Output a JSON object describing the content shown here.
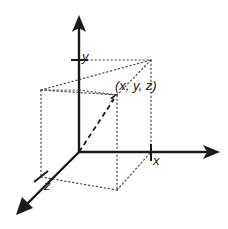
{
  "figure": {
    "type": "diagram",
    "background_color": "#ffffff",
    "stroke_color": "#1a1a1a",
    "dotted_color": "#4d4d4d"
  },
  "labels": {
    "y_axis": "y",
    "x_axis": "x",
    "z_axis": "z",
    "point": "(x, y, z)"
  },
  "geometry": {
    "origin": {
      "x": 79,
      "y": 152
    },
    "axes": [
      {
        "name": "y-axis",
        "from": {
          "x": 79,
          "y": 152
        },
        "to": {
          "x": 79,
          "y": 17
        },
        "arrow": true,
        "tick": {
          "x": 79,
          "y": 60
        }
      },
      {
        "name": "x-axis",
        "from": {
          "x": 79,
          "y": 152
        },
        "to": {
          "x": 218,
          "y": 152
        },
        "arrow": true,
        "tick": {
          "x": 151,
          "y": 152
        }
      },
      {
        "name": "z-axis",
        "from": {
          "x": 79,
          "y": 152
        },
        "to": {
          "x": 18,
          "y": 213
        },
        "arrow": true,
        "tick": {
          "x": 41,
          "y": 177
        }
      }
    ],
    "point": {
      "x": 117,
      "y": 95
    },
    "vector": {
      "from": {
        "x": 79,
        "y": 152
      },
      "to": {
        "x": 117,
        "y": 95
      },
      "style": "dashed",
      "arrow": true
    },
    "box_corners": {
      "back_top_left": {
        "x": 41,
        "y": 90
      },
      "back_top_right": {
        "x": 151,
        "y": 60
      },
      "front_top_right": {
        "x": 117,
        "y": 95
      },
      "front_top_left": {
        "x": 10,
        "y": 125
      },
      "back_bottom_left": {
        "x": 41,
        "y": 177
      },
      "back_bottom_right": {
        "x": 151,
        "y": 152
      },
      "front_bottom_right": {
        "x": 117,
        "y": 190
      }
    }
  }
}
